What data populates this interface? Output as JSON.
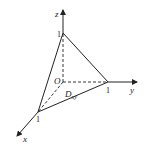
{
  "diagram": {
    "type": "3d-coordinate-tetrahedron",
    "axes": {
      "x": {
        "label": "x"
      },
      "y": {
        "label": "y"
      },
      "z": {
        "label": "z"
      }
    },
    "origin_label": "O",
    "region_label": "D",
    "region_subscript": "xy",
    "tick_labels": {
      "x_one": "1",
      "y_one": "1",
      "z_one": "1"
    },
    "colors": {
      "stroke": "#222222",
      "background": "#ffffff"
    }
  }
}
